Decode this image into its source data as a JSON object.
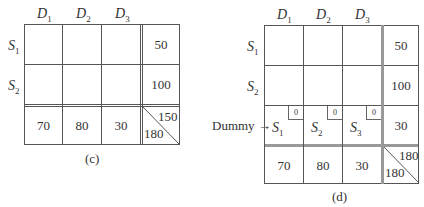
{
  "table_c": {
    "caption": "(c)",
    "columns": [
      {
        "base": "D",
        "sub": "1"
      },
      {
        "base": "D",
        "sub": "2"
      },
      {
        "base": "D",
        "sub": "3"
      }
    ],
    "rows": [
      {
        "base": "S",
        "sub": "1",
        "supply": "50"
      },
      {
        "base": "S",
        "sub": "2",
        "supply": "100"
      }
    ],
    "demand": [
      "70",
      "80",
      "30"
    ],
    "corner": {
      "supply_total": "150",
      "demand_total": "180"
    }
  },
  "table_d": {
    "caption": "(d)",
    "columns": [
      {
        "base": "D",
        "sub": "1"
      },
      {
        "base": "D",
        "sub": "2"
      },
      {
        "base": "D",
        "sub": "3"
      }
    ],
    "rows": [
      {
        "base": "S",
        "sub": "1",
        "supply": "50"
      },
      {
        "base": "S",
        "sub": "2",
        "supply": "100"
      }
    ],
    "dummy_row": {
      "label": "Dummy",
      "arrow": "→",
      "cells": [
        {
          "base": "S",
          "sub": "1",
          "cost": "0"
        },
        {
          "base": "S",
          "sub": "2",
          "cost": "0"
        },
        {
          "base": "S",
          "sub": "3",
          "cost": "0"
        }
      ],
      "supply": "30"
    },
    "demand": [
      "70",
      "80",
      "30"
    ],
    "corner": {
      "supply_total": "180",
      "demand_total": "180"
    }
  }
}
